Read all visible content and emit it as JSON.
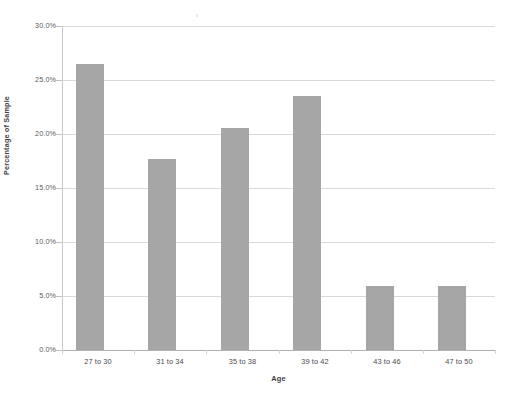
{
  "chart_data": {
    "type": "bar",
    "title": "",
    "categories": [
      "27 to 30",
      "31 to 34",
      "35 to 38",
      "39 to 42",
      "43 to 46",
      "47 to 50"
    ],
    "values": [
      26.5,
      17.7,
      20.6,
      23.5,
      5.9,
      5.9
    ],
    "xlabel": "Age",
    "ylabel": "Percentage of Sample",
    "ylim": [
      0,
      30
    ],
    "ytick_labels": [
      "30.0%",
      "25.0%",
      "20.0%",
      "15.0%",
      "10.0%",
      "5.0%",
      "0.0%"
    ],
    "ytick_values": [
      30,
      25,
      20,
      15,
      10,
      5,
      0
    ],
    "grid": true,
    "legend": false,
    "series": [
      {
        "name": "Percentage of Sample",
        "values": [
          26.5,
          17.7,
          20.6,
          23.5,
          5.9,
          5.9
        ]
      }
    ]
  },
  "style": {
    "bar_color": "#a6a6a6",
    "gridline_color": "#d9d9d9",
    "axis_color": "#b0b0b0",
    "text_color": "#4a4a4a",
    "background": "#ffffff"
  }
}
